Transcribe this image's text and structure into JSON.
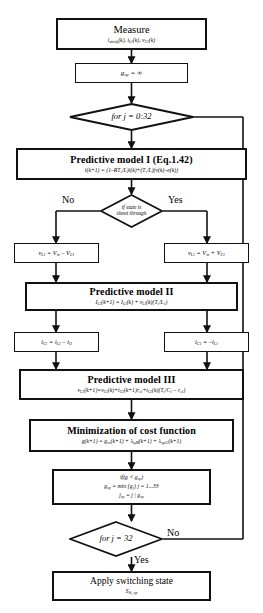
{
  "diagram": {
    "type": "flowchart",
    "nodes": {
      "measure": {
        "shape": "process",
        "title": "Measure",
        "formula": "i_abcdq(k), i_L1(k), v_C1(k)"
      },
      "init": {
        "shape": "process",
        "formula": "g_op = ∞"
      },
      "loop_start": {
        "shape": "decision",
        "label": "for j = 0:32"
      },
      "model1": {
        "shape": "process",
        "title": "Predictive model I (Eq.1.42)",
        "formula": "i(k+1) = (1–RT_s/L)i(k)+(T_s/L)(v(k)–e(k))"
      },
      "state_check": {
        "shape": "decision",
        "label_line1": "if state is",
        "label_line2": "shoot through",
        "no_label": "No",
        "yes_label": "Yes"
      },
      "vl_no": {
        "shape": "process",
        "formula": "v_L1 = V_in – V_C1"
      },
      "vl_yes": {
        "shape": "process",
        "formula": "v_L1 = V_in + V_C1"
      },
      "model2": {
        "shape": "process",
        "title": "Predictive model II",
        "formula": "I_L1(k+1) = I_L1(k) + v_L1(k)(T_s/L_1)"
      },
      "ic_no": {
        "shape": "process",
        "formula": "i_C1 = i_L1 – i_O"
      },
      "ic_yes": {
        "shape": "process",
        "formula": "i_C1 = –i_L1"
      },
      "model3": {
        "shape": "process",
        "title": "Predictive model III",
        "formula": "v_C1(k+1) = v_C1(k) + i_C1(k+1)r_c1 + i_C1(k)(T_s/C_1 – r_c1)"
      },
      "cost": {
        "shape": "process",
        "title": "Minimization of cost function",
        "formula": "g(k+1) = g_oc(k+1) + λ_iqM(k+1) + λ_vgvC(k+1)"
      },
      "update": {
        "shape": "process",
        "line1": "if(g < g_op)",
        "line2": "g_op = min {g_j} j = 1...33",
        "line3": "j_op = j | g_op"
      },
      "loop_end": {
        "shape": "decision",
        "label": "for j = 32",
        "no_label": "No",
        "yes_label": "Yes"
      },
      "apply": {
        "shape": "terminal",
        "title": "Apply switching state",
        "formula": "S_ik_op"
      }
    },
    "colors": {
      "stroke": "#111111",
      "fill": "#ffffff",
      "text": "#000000"
    }
  }
}
